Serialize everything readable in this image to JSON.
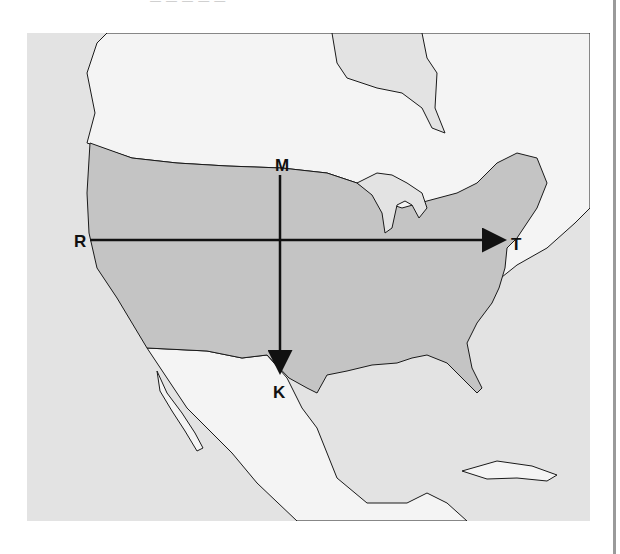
{
  "caption": {
    "top_text": "— — — — —"
  },
  "map": {
    "description": "Shaded relief map of North America with the contiguous United States highlighted in darker gray",
    "colors": {
      "ocean": "#e3e3e3",
      "land_other": "#f4f4f4",
      "usa": "#c4c4c4",
      "coastline": "#1a1a1a",
      "arrow": "#111111"
    },
    "labels": {
      "M": "M",
      "K": "K",
      "R": "R",
      "T": "T"
    },
    "arrows": [
      {
        "name": "north-south-arrow",
        "from": "M",
        "to": "K"
      },
      {
        "name": "west-east-arrow",
        "from": "R",
        "to": "T"
      }
    ]
  }
}
